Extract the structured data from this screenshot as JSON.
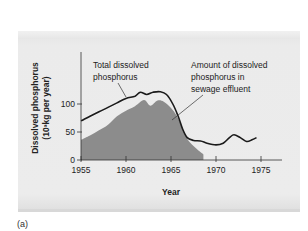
{
  "caption": "(a)",
  "chart_data": {
    "type": "area",
    "title": "",
    "xlabel": "Year",
    "ylabel": "Dissolved phosphorus",
    "ylabel_units": "(10³kg per year)",
    "xlim": [
      1955,
      1977
    ],
    "ylim": [
      0,
      140
    ],
    "x_ticks": [
      1955,
      1960,
      1965,
      1970,
      1975
    ],
    "x_tick_labels": [
      "1955",
      "1960",
      "1965",
      "1970",
      "1975"
    ],
    "y_ticks": [
      0,
      50,
      100
    ],
    "y_tick_labels": [
      "0",
      "50",
      "100"
    ],
    "grid": false,
    "legend_position": "none",
    "annotations": [
      {
        "text": [
          "Total dissolved",
          "phosphorus"
        ],
        "points_to": "Total dissolved phosphorus line",
        "approx_year": 1960.5
      },
      {
        "text": [
          "Amount of dissolved",
          "phosphorus in",
          "sewage effluent"
        ],
        "points_to": "shaded area",
        "approx_year": 1965.5
      }
    ],
    "series": [
      {
        "name": "Total dissolved phosphorus",
        "style": "line",
        "color": "#1a1a1a",
        "x": [
          1955,
          1956,
          1957,
          1958,
          1959,
          1960,
          1961,
          1961.6,
          1962.3,
          1963,
          1963.8,
          1964.5,
          1965.2,
          1965.8,
          1966.3,
          1966.8,
          1967.5,
          1968.3,
          1969,
          1970,
          1970.8,
          1971.5,
          1972,
          1972.7,
          1973.4,
          1974,
          1974.5
        ],
        "values": [
          70,
          78,
          86,
          94,
          102,
          110,
          114,
          121,
          117,
          121,
          122,
          117,
          100,
          78,
          55,
          40,
          35,
          34,
          30,
          27,
          30,
          40,
          45,
          40,
          33,
          36,
          40
        ]
      },
      {
        "name": "Amount of dissolved phosphorus in sewage effluent",
        "style": "filled_area",
        "color": "#8c8c8c",
        "x": [
          1955,
          1956,
          1957,
          1958,
          1959,
          1960,
          1961,
          1962,
          1962.7,
          1963.5,
          1964.2,
          1965,
          1965.6,
          1966.2,
          1966.8,
          1967.5,
          1968.2,
          1968.6
        ],
        "values": [
          36,
          44,
          53,
          63,
          78,
          88,
          96,
          107,
          97,
          106,
          104,
          93,
          80,
          60,
          38,
          25,
          15,
          10
        ]
      }
    ]
  }
}
